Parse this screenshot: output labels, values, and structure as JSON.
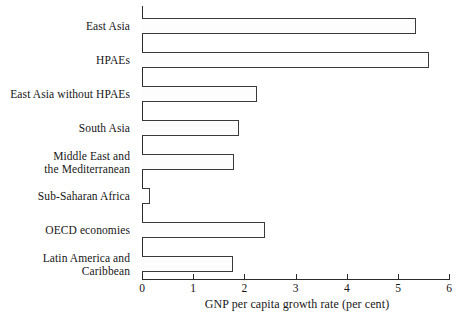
{
  "chart_data": {
    "type": "bar",
    "orientation": "horizontal",
    "title": "",
    "xlabel": "GNP per capita growth rate (per cent)",
    "ylabel": "",
    "xlim": [
      0,
      6
    ],
    "xticks": [
      "0",
      "1",
      "2",
      "3",
      "4",
      "5",
      "6"
    ],
    "grid": false,
    "legend": null,
    "categories": [
      "East Asia",
      "HPAEs",
      "East Asia without HPAEs",
      "South Asia",
      "Middle East and\nthe Mediterranean",
      "Sub-Saharan Africa",
      "OECD economies",
      "Latin America and\nCaribbean"
    ],
    "values": [
      5.35,
      5.6,
      2.25,
      1.9,
      1.8,
      0.16,
      2.4,
      1.78
    ],
    "bar_face_color": "#fdfdfd",
    "bar_edge_color": "#3a3a3a",
    "axis_color": "#2b2b2b"
  }
}
